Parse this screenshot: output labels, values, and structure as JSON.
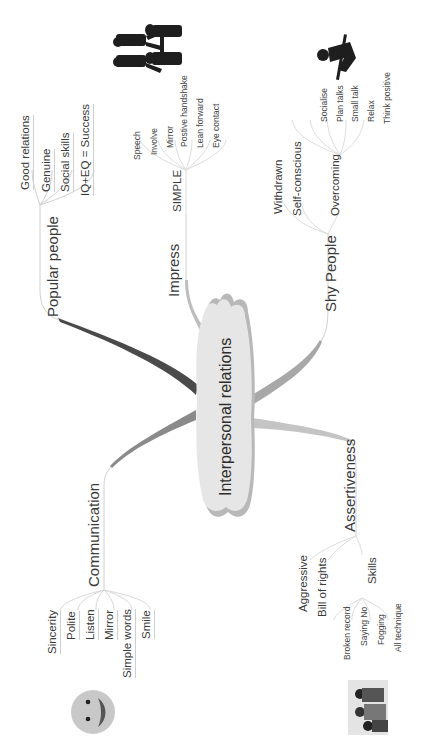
{
  "mindmap": {
    "center": {
      "label": "Interpersonal relations"
    },
    "branches": [
      {
        "label": "Popular people",
        "children": [
          {
            "label": "Good relations"
          },
          {
            "label": "Genuine"
          },
          {
            "label": "Social skills"
          },
          {
            "label": "IQ+EQ = Success"
          }
        ],
        "image": "people-walking-silhouette"
      },
      {
        "label": "Impress",
        "children": [
          {
            "label": "SIMPLE",
            "children": [
              {
                "label": "Speech"
              },
              {
                "label": "Involve"
              },
              {
                "label": "Mirror"
              },
              {
                "label": "Postive handshake"
              },
              {
                "label": "Lean forward"
              },
              {
                "label": "Eye contact"
              }
            ]
          }
        ],
        "image": "handshake-silhouette"
      },
      {
        "label": "Shy People",
        "children": [
          {
            "label": "Withdrawn"
          },
          {
            "label": "Self-conscious"
          },
          {
            "label": "Overcoming",
            "children": [
              {
                "label": "Socialise"
              },
              {
                "label": "Plan talks"
              },
              {
                "label": "Small talk"
              },
              {
                "label": "Relax"
              },
              {
                "label": "Think positive"
              }
            ]
          }
        ],
        "image": "person-climbing-silhouette"
      },
      {
        "label": "Assertiveness",
        "children": [
          {
            "label": "Aggressive"
          },
          {
            "label": "Bill of rights"
          },
          {
            "label": "Skills",
            "children": [
              {
                "label": "Broken record"
              },
              {
                "label": "Saying No"
              },
              {
                "label": "Fogging"
              },
              {
                "label": "All technique"
              }
            ]
          }
        ],
        "image": "group-of-people-photo"
      },
      {
        "label": "Communication",
        "children": [
          {
            "label": "Sincerity"
          },
          {
            "label": "Polite"
          },
          {
            "label": "Listen"
          },
          {
            "label": "Mirror"
          },
          {
            "label": "Simple words"
          },
          {
            "label": "Smile"
          }
        ],
        "image": "smiley-face"
      }
    ],
    "colors": {
      "center_fill": "#e6e6e6",
      "center_shadow": "#b8b8b8",
      "branch_popular": "#4a4a4a",
      "branch_communication": "#8a8a8a",
      "branch_shy": "#a8a8a8",
      "branch_assertive": "#c4c4c4",
      "branch_impress": "#bdbdbd",
      "thin_line": "#d2d2d2"
    }
  }
}
